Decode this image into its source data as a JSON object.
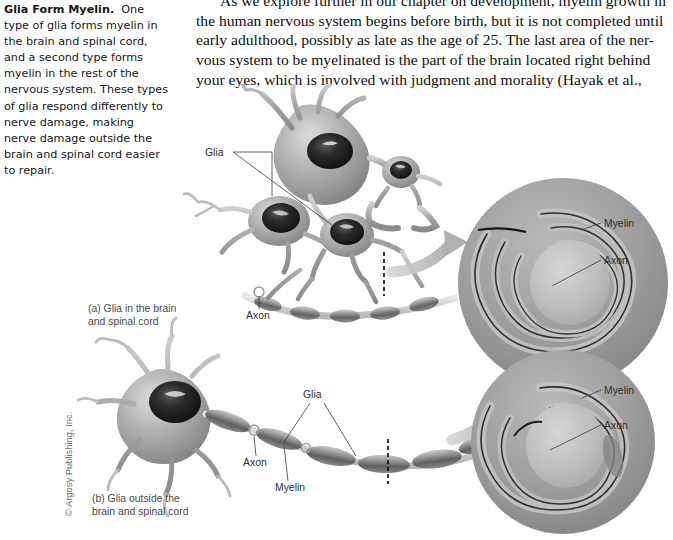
{
  "page": {
    "background_color": "#ffffff",
    "width": 673,
    "height": 540
  },
  "caption": {
    "title": "Glia Form Myelin.",
    "body": "One type of glia forms myelin in the brain and spinal cord, and a second type forms myelin in the rest of the nervous system. These types of glia respond differently to nerve damage, making nerve damage outside the brain and spinal cord easier to repair."
  },
  "body_text": {
    "lines": [
      "As we explore further in our chapter on development, myelin growth in",
      "the human nervous system begins before birth, but it is not completed until",
      "early adulthood, possibly as late as the age of 25. The last area of the ner-",
      "vous system to be myelinated is the part of the brain located right behind",
      "your eyes, which is involved with judgment and morality (Hayak et al.,"
    ]
  },
  "figure": {
    "panel_a": {
      "caption_line1": "(a) Glia in the brain",
      "caption_line2": "and spinal cord",
      "labels": {
        "glia": "Glia",
        "axon": "Axon"
      },
      "cross_section": {
        "myelin": "Myelin",
        "axon": "Axon"
      }
    },
    "panel_b": {
      "caption_line1": "(b) Glia outside the",
      "caption_line2": "brain and spinal cord",
      "labels": {
        "glia": "Glia",
        "axon": "Axon",
        "myelin": "Myelin"
      },
      "cross_section": {
        "myelin": "Myelin",
        "axon": "Axon"
      }
    },
    "credit": "© Argosy Publishing, Inc.",
    "colors": {
      "cell_gray": "#8e8e8e",
      "nucleus_dark": "#1e1e1e",
      "circle_gray": "#9a9a9a",
      "arrow_gray": "#b4b4b4",
      "label_text": "#2f2f2f",
      "cut_line": "#111111"
    }
  }
}
